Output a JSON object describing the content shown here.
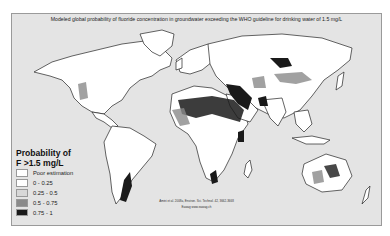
{
  "title": "Modeled global probability of fluoride concentration in groundwater exceeding the WHO guideline for drinking water of 1.5 mg/L",
  "legend": {
    "title_line1": "Probability of",
    "title_line2": "F >1.5 mg/L",
    "items": [
      {
        "label": "Poor estimation",
        "color": "#ffffff"
      },
      {
        "label": "0 - 0.25",
        "color": "#ffffff"
      },
      {
        "label": "0.25 - 0.5",
        "color": "#d8d8d8"
      },
      {
        "label": "0.5 - 0.75",
        "color": "#8a8a8a"
      },
      {
        "label": "0.75 - 1",
        "color": "#1a1a1a"
      }
    ]
  },
  "citation": {
    "line1": "Amini et al. 2008a, Environ. Sci. Technol. 42, 3662-3668",
    "line2": "Eawag www.eawag.ch"
  },
  "colors": {
    "ocean": "#e4e4e4",
    "land": "#ffffff",
    "outline": "#222222",
    "high": "#1a1a1a",
    "mid": "#8a8a8a"
  }
}
